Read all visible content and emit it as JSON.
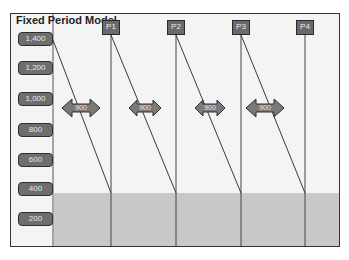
{
  "title": "Fixed Period Model",
  "y_labels": [
    "1,400",
    "1,200",
    "1,000",
    "800",
    "600",
    "400",
    "200"
  ],
  "periods": [
    "P1",
    "P2",
    "P3",
    "P4"
  ],
  "interval_labels": [
    "900",
    "900",
    "900",
    "900"
  ],
  "colors": {
    "frame_bg": "#f4f4f4",
    "safety_stock_fill": "#c8c8c8",
    "label_fill": "#6e6e6e",
    "line": "#3a3a3a"
  }
}
